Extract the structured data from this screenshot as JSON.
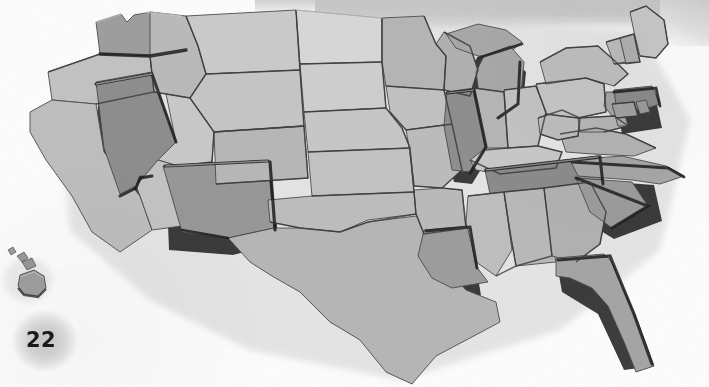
{
  "page": {
    "folio": "22",
    "background_color": "#ffffff"
  },
  "photo": {
    "subject": "3D relief puzzle map of the United States",
    "style": "grayscale photograph",
    "alt": "Grayscale photo of a three-dimensional jigsaw-style relief map of the contiguous United States with individual raised state pieces, plus the Hawaiian island chain at lower left",
    "top_band_color": "#c8c8c8",
    "palette": {
      "lightest_state": "#d9d9d9",
      "light_state": "#cacaca",
      "mid_state": "#b4b4b4",
      "dark_state": "#9a9a9a",
      "darkest_state": "#858585",
      "edge_shadow": "#2e2e2e",
      "drop_shadow": "#8f8f8f"
    }
  },
  "map": {
    "title": "United States relief map",
    "regions": [
      {
        "name": "Washington",
        "tone": "#9d9d9d",
        "raised": true
      },
      {
        "name": "Oregon",
        "tone": "#c1c1c1",
        "raised": false
      },
      {
        "name": "California",
        "tone": "#bdbdbd",
        "raised": false
      },
      {
        "name": "Nevada",
        "tone": "#8d8d8d",
        "raised": true
      },
      {
        "name": "Idaho",
        "tone": "#b9b9b9",
        "raised": false
      },
      {
        "name": "Montana",
        "tone": "#c9c9c9",
        "raised": false
      },
      {
        "name": "Wyoming",
        "tone": "#c4c4c4",
        "raised": false
      },
      {
        "name": "Utah",
        "tone": "#c7c7c7",
        "raised": false
      },
      {
        "name": "Arizona",
        "tone": "#c2c2c2",
        "raised": false
      },
      {
        "name": "New Mexico",
        "tone": "#979797",
        "raised": true
      },
      {
        "name": "Colorado",
        "tone": "#b6b6b6",
        "raised": false
      },
      {
        "name": "North Dakota",
        "tone": "#d6d6d6",
        "raised": false
      },
      {
        "name": "South Dakota",
        "tone": "#cdcdcd",
        "raised": false
      },
      {
        "name": "Nebraska",
        "tone": "#c6c6c6",
        "raised": false
      },
      {
        "name": "Kansas",
        "tone": "#c1c1c1",
        "raised": false
      },
      {
        "name": "Oklahoma",
        "tone": "#bcbcbc",
        "raised": false
      },
      {
        "name": "Texas",
        "tone": "#b5b5b5",
        "raised": false
      },
      {
        "name": "Minnesota",
        "tone": "#b4b4b4",
        "raised": false
      },
      {
        "name": "Iowa",
        "tone": "#c0c0c0",
        "raised": false
      },
      {
        "name": "Missouri",
        "tone": "#bbbbbb",
        "raised": false
      },
      {
        "name": "Arkansas",
        "tone": "#b9b9b9",
        "raised": false
      },
      {
        "name": "Louisiana",
        "tone": "#9c9c9c",
        "raised": true
      },
      {
        "name": "Wisconsin",
        "tone": "#b0b0b0",
        "raised": false
      },
      {
        "name": "Michigan",
        "tone": "#a8a8a8",
        "raised": true
      },
      {
        "name": "Illinois",
        "tone": "#8e8e8e",
        "raised": true
      },
      {
        "name": "Indiana",
        "tone": "#b5b5b5",
        "raised": false
      },
      {
        "name": "Ohio",
        "tone": "#c2c2c2",
        "raised": false
      },
      {
        "name": "Kentucky",
        "tone": "#c7c7c7",
        "raised": false
      },
      {
        "name": "Tennessee",
        "tone": "#8b8b8b",
        "raised": true
      },
      {
        "name": "Mississippi",
        "tone": "#bdbdbd",
        "raised": false
      },
      {
        "name": "Alabama",
        "tone": "#b8b8b8",
        "raised": false
      },
      {
        "name": "Georgia",
        "tone": "#b0b0b0",
        "raised": false
      },
      {
        "name": "Florida",
        "tone": "#a4a4a4",
        "raised": true
      },
      {
        "name": "South Carolina",
        "tone": "#9b9b9b",
        "raised": true
      },
      {
        "name": "North Carolina",
        "tone": "#a6a6a6",
        "raised": true
      },
      {
        "name": "Virginia",
        "tone": "#b2b2b2",
        "raised": false
      },
      {
        "name": "West Virginia",
        "tone": "#bcbcbc",
        "raised": false
      },
      {
        "name": "Pennsylvania",
        "tone": "#c4c4c4",
        "raised": false
      },
      {
        "name": "New York",
        "tone": "#bdbdbd",
        "raised": false
      },
      {
        "name": "Maine",
        "tone": "#c6c6c6",
        "raised": false
      },
      {
        "name": "Vermont",
        "tone": "#b9b9b9",
        "raised": false
      },
      {
        "name": "New Hampshire",
        "tone": "#aeaeae",
        "raised": false
      },
      {
        "name": "Massachusetts",
        "tone": "#8a8a8a",
        "raised": true
      },
      {
        "name": "Connecticut",
        "tone": "#9f9f9f",
        "raised": false
      },
      {
        "name": "Rhode Island",
        "tone": "#999999",
        "raised": false
      },
      {
        "name": "New Jersey",
        "tone": "#a3a3a3",
        "raised": false
      },
      {
        "name": "Delaware",
        "tone": "#a9a9a9",
        "raised": false
      },
      {
        "name": "Maryland",
        "tone": "#b4b4b4",
        "raised": false
      },
      {
        "name": "Hawaii",
        "tone": "#9e9e9e",
        "raised": false
      }
    ]
  }
}
